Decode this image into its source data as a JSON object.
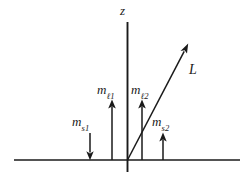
{
  "figure": {
    "background_color": "#ffffff",
    "line_color": "#1a1a1a",
    "width": 250,
    "height": 181,
    "axes": {
      "vertical": {
        "name": "z-axis",
        "label": "z",
        "x": 127.5,
        "y_top": 22,
        "y_bottom": 172
      },
      "horizontal": {
        "name": "horizontal-axis",
        "label": "",
        "y": 160,
        "x_left": 14,
        "x_right": 240
      },
      "origin": {
        "x": 127.5,
        "y": 160
      }
    },
    "vectors": [
      {
        "id": "ms1",
        "symbol": "m",
        "subscript": "s1",
        "subscript_parts": {
          "letter": "s",
          "index": "1"
        },
        "direction": "down",
        "x": 90,
        "y_tail": 133,
        "y_head": 159,
        "label_text": "m_s1"
      },
      {
        "id": "ml1",
        "symbol": "m",
        "subscript": "ℓ1",
        "subscript_parts": {
          "letter": "ℓ",
          "index": "1"
        },
        "direction": "up",
        "x": 112,
        "y_tail": 160,
        "y_head": 100,
        "label_text": "m_ℓ1"
      },
      {
        "id": "ml2",
        "symbol": "m",
        "subscript": "ℓ2",
        "subscript_parts": {
          "letter": "ℓ",
          "index": "2"
        },
        "direction": "up",
        "x": 142,
        "y_tail": 160,
        "y_head": 100,
        "label_text": "m_ℓ2"
      },
      {
        "id": "ms2",
        "symbol": "m",
        "subscript": "s2",
        "subscript_parts": {
          "letter": "s",
          "index": "2"
        },
        "direction": "up",
        "x": 163,
        "y_tail": 160,
        "y_head": 133,
        "label_text": "m_s2"
      },
      {
        "id": "L",
        "symbol": "L",
        "subscript": "",
        "direction": "diagonal-up-right",
        "x_tail": 127.5,
        "y_tail": 160,
        "x_head": 188,
        "y_head": 44,
        "label_text": "L"
      }
    ],
    "labels": {
      "z": "z",
      "L": "L",
      "m": "m",
      "ml1_sub_letter": "ℓ",
      "ml1_sub_index": "1",
      "ml2_sub_letter": "ℓ",
      "ml2_sub_index": "2",
      "ms1_sub_letter": "s",
      "ms1_sub_index": "1",
      "ms2_sub_letter": "s",
      "ms2_sub_index": "2"
    }
  }
}
